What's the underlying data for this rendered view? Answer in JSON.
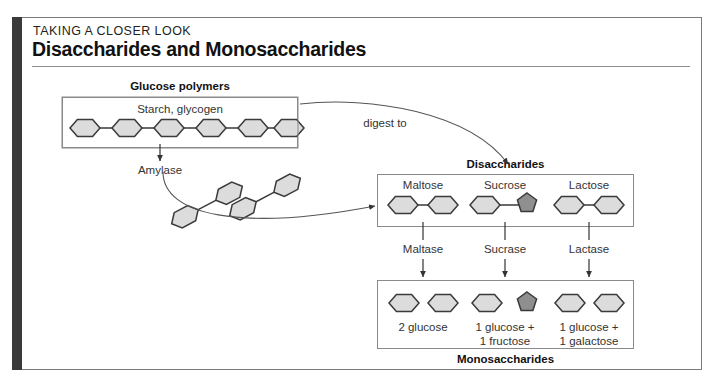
{
  "panel": {
    "kicker": "TAKING A CLOSER LOOK",
    "title": "Disaccharides and Monosaccharides"
  },
  "sections": {
    "glucose_polymers_heading": "Glucose polymers",
    "starch_label": "Starch, glycogen",
    "amylase_label": "Amylase",
    "digest_to_label": "digest to",
    "disaccharides_heading": "Disaccharides",
    "monosaccharides_heading": "Monosaccharides"
  },
  "disaccharides": [
    {
      "name": "Maltose",
      "enzyme": "Maltase",
      "products_line1": "2 glucose",
      "products_line2": ""
    },
    {
      "name": "Sucrose",
      "enzyme": "Sucrase",
      "products_line1": "1 glucose +",
      "products_line2": "1 fructose"
    },
    {
      "name": "Lactose",
      "enzyme": "Lactase",
      "products_line1": "1 glucose +",
      "products_line2": "1 galactose"
    }
  ],
  "icons": {
    "glucose_hexagon": "hexagon-glucose-icon",
    "fructose_pentagon": "pentagon-fructose-icon",
    "arrow_down": "arrow-down-icon",
    "curved_arrow": "curved-arrow-icon"
  },
  "colors": {
    "sugar_fill_light": "#dcdcdc",
    "sugar_fill_dark": "#8f8f8f",
    "sugar_stroke": "#3a3a3a",
    "panel_border": "#7b7b7b",
    "spine": "#3a3a3a",
    "text": "#231f20"
  }
}
